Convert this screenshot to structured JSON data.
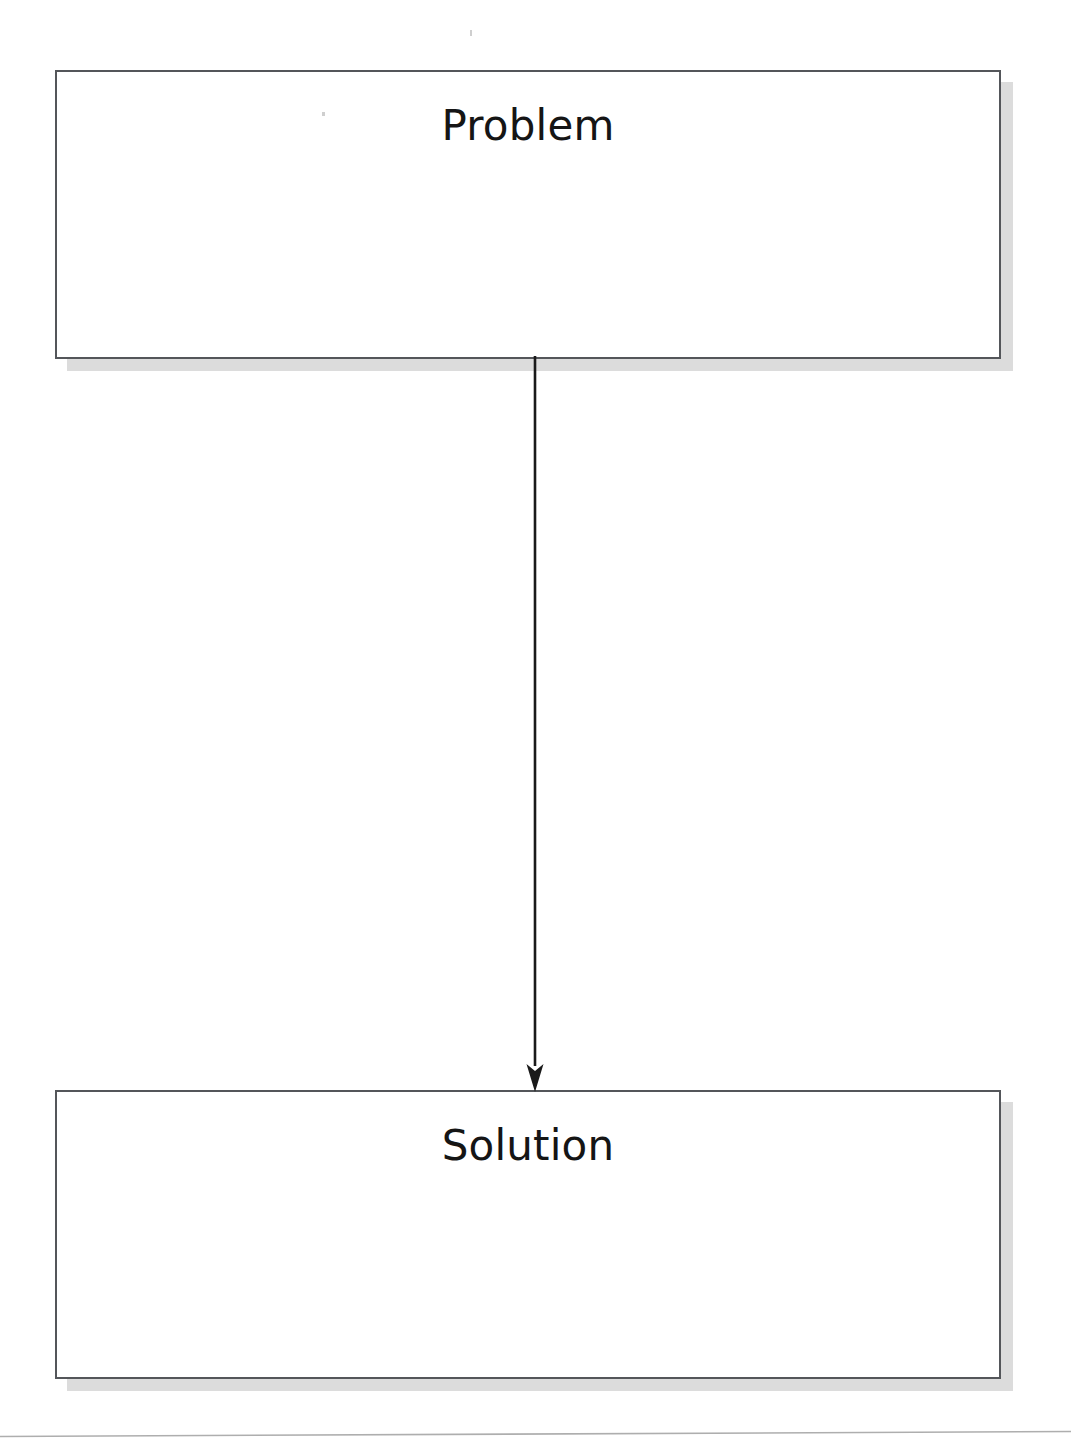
{
  "page": {
    "background_color": "#ffffff",
    "width": 1071,
    "height": 1449
  },
  "diagram": {
    "node_border_color": "#54565a",
    "node_fill_color": "#ffffff",
    "node_shadow_color": "#dcdcdc",
    "connector_color": "#1a1a1a",
    "text_color": "#151515",
    "nodes": [
      {
        "id": "problem",
        "label": "Problem",
        "body_text": ""
      },
      {
        "id": "solution",
        "label": "Solution",
        "body_text": ""
      }
    ],
    "connectors": [
      {
        "id": "problem-to-solution",
        "from": "problem",
        "to": "solution",
        "arrowhead": "filled-triangle",
        "direction": "down",
        "label": ""
      }
    ]
  },
  "footer": {
    "rule_color": "#aeaeae"
  }
}
